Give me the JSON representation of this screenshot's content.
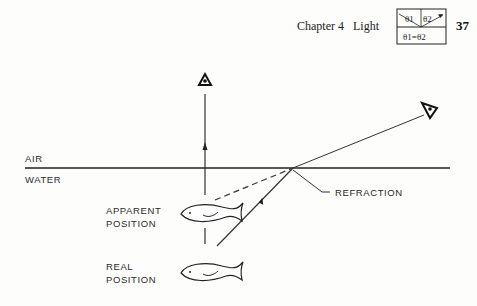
{
  "header": {
    "chapter": "Chapter 4",
    "title": "Light",
    "page_number": "37",
    "inset_box": {
      "top_left": "θ1",
      "top_right": "θ2",
      "bottom": "θ1=θ2"
    }
  },
  "figure": {
    "labels": {
      "air": "AIR",
      "water": "WATER",
      "refraction": "REFRACTION",
      "apparent_line1": "APPARENT",
      "apparent_line2": "POSITION",
      "real_line1": "REAL",
      "real_line2": "POSITION"
    },
    "elements": [
      "eye-above-icon",
      "eye-side-icon",
      "water-surface-line",
      "light-ray",
      "dashed-projection",
      "apparent-fish",
      "real-fish"
    ]
  }
}
